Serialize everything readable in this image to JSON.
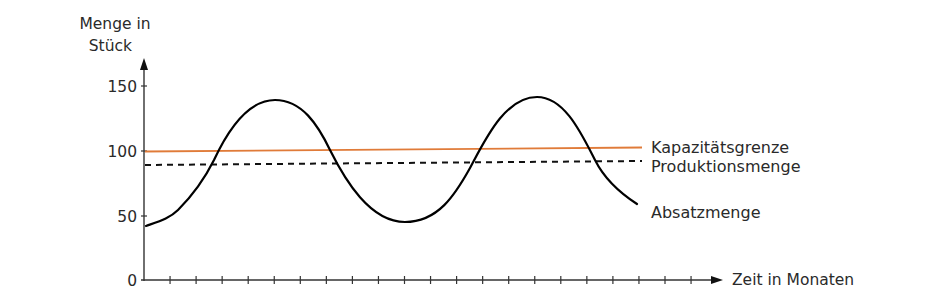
{
  "chart_data": {
    "type": "line",
    "title": "",
    "ylabel": "Menge in Stück",
    "ylabel_lines": [
      "Menge in",
      "Stück"
    ],
    "xlabel": "Zeit in Monaten",
    "ylim": [
      0,
      160
    ],
    "xlim": [
      0,
      22
    ],
    "y_ticks": [
      0,
      50,
      100,
      150
    ],
    "y_tick_labels": [
      "0",
      "50",
      "100",
      "150"
    ],
    "x_tick_count": 21,
    "x_tick_labels": [],
    "grid": false,
    "legend_position": "right, inline labels at line ends",
    "series": [
      {
        "name": "Kapazitätsgrenze",
        "style": "solid",
        "color": "#E07B39",
        "x": [
          0,
          19
        ],
        "values": [
          100,
          102
        ]
      },
      {
        "name": "Produktionsmenge",
        "style": "dashed",
        "color": "#000000",
        "x": [
          0,
          19
        ],
        "values": [
          88,
          90
        ]
      },
      {
        "name": "Absatzmenge",
        "style": "solid",
        "color": "#000000",
        "x": [
          0,
          1.2,
          2.5,
          3.5,
          5,
          6.5,
          7.5,
          8.5,
          10,
          11.5,
          12.5,
          13.5,
          15,
          16.5,
          17.5,
          19
        ],
        "values": [
          42,
          52,
          80,
          120,
          140,
          125,
          95,
          62,
          45,
          62,
          95,
          128,
          142,
          115,
          80,
          59
        ]
      }
    ]
  },
  "labels": {
    "y_axis_line1": "Menge in",
    "y_axis_line2": "Stück",
    "x_axis": "Zeit in Monaten",
    "tick_0": "0",
    "tick_50": "50",
    "tick_100": "100",
    "tick_150": "150",
    "legend_capacity": "Kapazitätsgrenze",
    "legend_production": "Produktionsmenge",
    "legend_sales": "Absatzmenge"
  },
  "colors": {
    "capacity": "#E07B39",
    "axis": "#333333",
    "curve": "#000000"
  }
}
